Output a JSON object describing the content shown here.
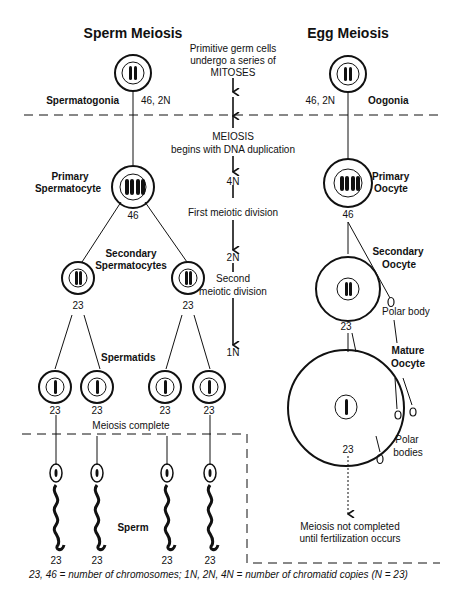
{
  "diagram": {
    "sperm_title": "Sperm Meiosis",
    "egg_title": "Egg Meiosis",
    "center": {
      "mitoses_text_1": "Primitive germ cells",
      "mitoses_text_2": "undergo a series of",
      "mitoses_text_3": "MITOSES",
      "meiosis_text_1": "MEIOSIS",
      "meiosis_text_2": "begins with DNA duplication",
      "stage_4n": "4N",
      "first_division": "First meiotic division",
      "stage_2n": "2N",
      "second_division_1": "Second",
      "second_division_2": "meiotic division",
      "stage_1n": "1N"
    },
    "sperm": {
      "spermatogonia_label": "Spermatogonia",
      "spermatogonia_count": "46, 2N",
      "primary_label_1": "Primary",
      "primary_label_2": "Spermatocyte",
      "primary_count": "46",
      "secondary_label_1": "Secondary",
      "secondary_label_2": "Spermatocytes",
      "secondary_counts": [
        "23",
        "23"
      ],
      "spermatids_label": "Spermatids",
      "spermatid_counts": [
        "23",
        "23",
        "23",
        "23"
      ],
      "meiosis_complete": "Meiosis complete",
      "sperm_label": "Sperm",
      "sperm_counts": [
        "23",
        "23",
        "23",
        "23"
      ]
    },
    "egg": {
      "oogonia_label": "Oogonia",
      "oogonia_count": "46, 2N",
      "primary_label_1": "Primary",
      "primary_label_2": "Oocyte",
      "primary_count": "46",
      "secondary_label_1": "Secondary",
      "secondary_label_2": "Oocyte",
      "secondary_count": "23",
      "polar_body": "Polar body",
      "mature_label_1": "Mature",
      "mature_label_2": "Oocyte",
      "mature_count": "23",
      "polar_bodies_1": "Polar",
      "polar_bodies_2": "bodies",
      "not_completed_1": "Meiosis not completed",
      "not_completed_2": "until fertilization occurs"
    },
    "footnote": "23, 46 = number of chromosomes; 1N, 2N, 4N = number of chromatid copies  (N = 23)"
  }
}
